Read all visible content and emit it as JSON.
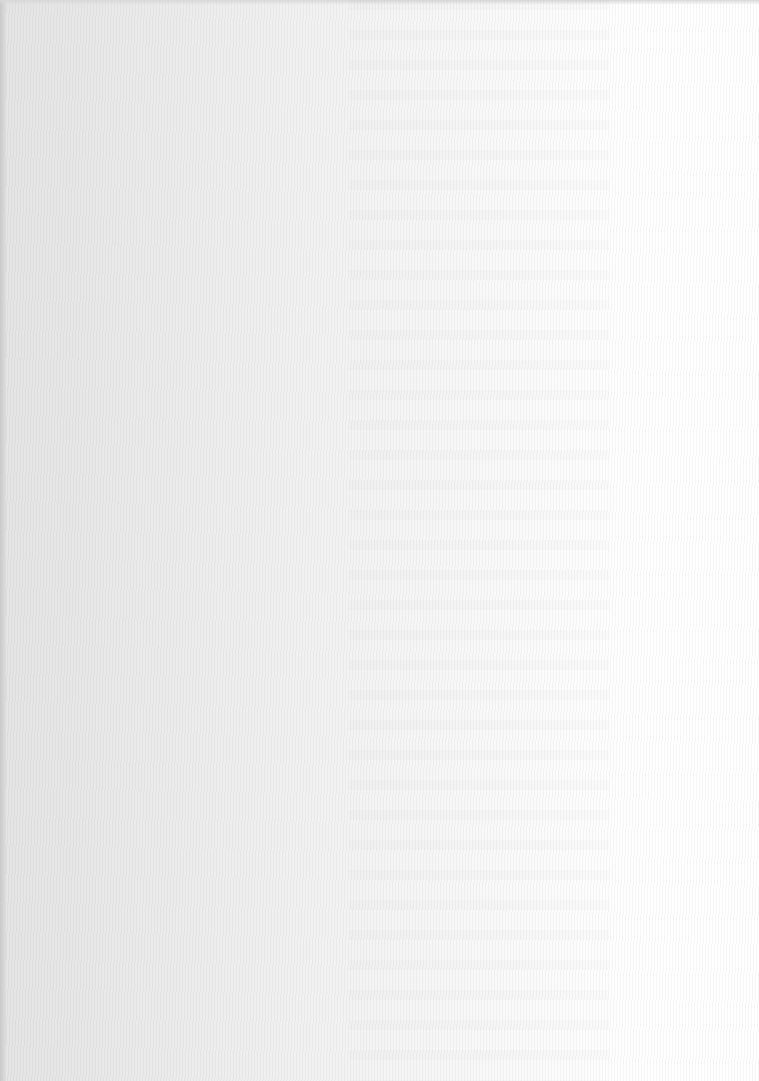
{
  "page": {
    "type": "blank scanned page",
    "text_content": "",
    "background_color": "#f2f2f2"
  }
}
